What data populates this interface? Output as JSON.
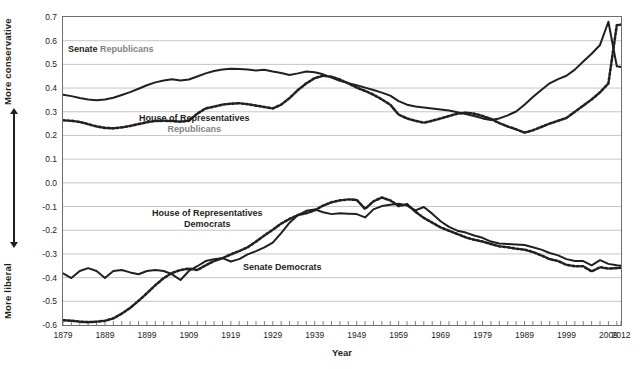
{
  "chart_data": {
    "type": "line",
    "title": "",
    "xlabel": "Year",
    "ylabel": "",
    "xlim": [
      1879,
      2012
    ],
    "ylim": [
      -0.6,
      0.7
    ],
    "grid": true,
    "legend_position": "inline-annotations",
    "y_ticks": [
      "0.7",
      "0.6",
      "0.5",
      "0.4",
      "0.3",
      "0.2",
      "0.1",
      "0.0",
      "-0.1",
      "-0.2",
      "-0.3",
      "-0.4",
      "-0.5",
      "-0.6"
    ],
    "y_tick_values": [
      0.7,
      0.6,
      0.5,
      0.4,
      0.3,
      0.2,
      0.1,
      0.0,
      -0.1,
      -0.2,
      -0.3,
      -0.4,
      -0.5,
      -0.6
    ],
    "x_ticks": [
      "1879",
      "1889",
      "1899",
      "1909",
      "1919",
      "1929",
      "1939",
      "1949",
      "1959",
      "1969",
      "1979",
      "1989",
      "1999",
      "2009",
      "2012"
    ],
    "x_tick_values": [
      1879,
      1889,
      1899,
      1909,
      1919,
      1929,
      1939,
      1949,
      1959,
      1969,
      1979,
      1989,
      1999,
      2009,
      2012
    ],
    "axis_direction_top": "More conservative",
    "axis_direction_bottom": "More liberal",
    "x": [
      1879,
      1881,
      1883,
      1885,
      1887,
      1889,
      1891,
      1893,
      1895,
      1897,
      1899,
      1901,
      1903,
      1905,
      1907,
      1909,
      1911,
      1913,
      1915,
      1917,
      1919,
      1921,
      1923,
      1925,
      1927,
      1929,
      1931,
      1933,
      1935,
      1937,
      1939,
      1941,
      1943,
      1945,
      1947,
      1949,
      1951,
      1953,
      1955,
      1957,
      1959,
      1961,
      1963,
      1965,
      1967,
      1969,
      1971,
      1973,
      1975,
      1977,
      1979,
      1981,
      1983,
      1985,
      1987,
      1989,
      1991,
      1993,
      1995,
      1997,
      1999,
      2001,
      2003,
      2005,
      2007,
      2009,
      2011,
      2012
    ],
    "series": [
      {
        "name": "Senate Republicans",
        "style": "solid",
        "color": "#231f20",
        "values": [
          0.372,
          0.366,
          0.358,
          0.352,
          0.349,
          0.352,
          0.359,
          0.371,
          0.383,
          0.397,
          0.412,
          0.424,
          0.432,
          0.437,
          0.432,
          0.436,
          0.449,
          0.462,
          0.472,
          0.478,
          0.482,
          0.481,
          0.478,
          0.474,
          0.477,
          0.47,
          0.464,
          0.455,
          0.462,
          0.47,
          0.467,
          0.458,
          0.444,
          0.431,
          0.421,
          0.412,
          0.402,
          0.392,
          0.381,
          0.368,
          0.345,
          0.33,
          0.322,
          0.318,
          0.314,
          0.31,
          0.305,
          0.298,
          0.29,
          0.282,
          0.272,
          0.265,
          0.272,
          0.285,
          0.301,
          0.33,
          0.362,
          0.392,
          0.42,
          0.438,
          0.452,
          0.478,
          0.512,
          0.545,
          0.582,
          0.68,
          0.492,
          0.489
        ]
      },
      {
        "name": "House of Representatives Republicans",
        "style": "dotted",
        "color": "#231f20",
        "values": [
          0.264,
          0.262,
          0.257,
          0.248,
          0.238,
          0.232,
          0.23,
          0.234,
          0.24,
          0.248,
          0.256,
          0.261,
          0.262,
          0.261,
          0.258,
          0.262,
          0.292,
          0.314,
          0.322,
          0.33,
          0.334,
          0.336,
          0.332,
          0.326,
          0.32,
          0.314,
          0.33,
          0.358,
          0.392,
          0.42,
          0.442,
          0.452,
          0.448,
          0.436,
          0.42,
          0.402,
          0.388,
          0.372,
          0.352,
          0.33,
          0.288,
          0.272,
          0.262,
          0.254,
          0.262,
          0.272,
          0.282,
          0.292,
          0.296,
          0.292,
          0.282,
          0.27,
          0.252,
          0.238,
          0.226,
          0.212,
          0.222,
          0.236,
          0.25,
          0.262,
          0.274,
          0.3,
          0.326,
          0.352,
          0.382,
          0.42,
          0.665,
          0.668
        ]
      },
      {
        "name": "Senate Democrats",
        "style": "solid",
        "color": "#231f20",
        "values": [
          -0.382,
          -0.402,
          -0.372,
          -0.36,
          -0.372,
          -0.402,
          -0.372,
          -0.368,
          -0.378,
          -0.386,
          -0.372,
          -0.368,
          -0.372,
          -0.386,
          -0.41,
          -0.372,
          -0.352,
          -0.33,
          -0.322,
          -0.318,
          -0.332,
          -0.322,
          -0.302,
          -0.288,
          -0.272,
          -0.252,
          -0.212,
          -0.168,
          -0.136,
          -0.118,
          -0.112,
          -0.124,
          -0.132,
          -0.128,
          -0.13,
          -0.132,
          -0.146,
          -0.112,
          -0.098,
          -0.092,
          -0.088,
          -0.096,
          -0.116,
          -0.102,
          -0.13,
          -0.162,
          -0.186,
          -0.202,
          -0.21,
          -0.222,
          -0.232,
          -0.248,
          -0.256,
          -0.258,
          -0.26,
          -0.262,
          -0.272,
          -0.282,
          -0.296,
          -0.306,
          -0.322,
          -0.33,
          -0.33,
          -0.348,
          -0.326,
          -0.342,
          -0.348,
          -0.35
        ]
      },
      {
        "name": "House of Representatives Democrats",
        "style": "dotted",
        "color": "#231f20",
        "values": [
          -0.58,
          -0.582,
          -0.586,
          -0.588,
          -0.586,
          -0.582,
          -0.572,
          -0.552,
          -0.528,
          -0.498,
          -0.466,
          -0.432,
          -0.402,
          -0.38,
          -0.368,
          -0.362,
          -0.368,
          -0.348,
          -0.33,
          -0.318,
          -0.302,
          -0.288,
          -0.272,
          -0.248,
          -0.222,
          -0.198,
          -0.172,
          -0.152,
          -0.136,
          -0.128,
          -0.116,
          -0.096,
          -0.082,
          -0.074,
          -0.07,
          -0.072,
          -0.11,
          -0.078,
          -0.062,
          -0.074,
          -0.098,
          -0.09,
          -0.122,
          -0.148,
          -0.168,
          -0.188,
          -0.202,
          -0.216,
          -0.23,
          -0.24,
          -0.248,
          -0.258,
          -0.268,
          -0.272,
          -0.278,
          -0.282,
          -0.292,
          -0.306,
          -0.322,
          -0.33,
          -0.346,
          -0.352,
          -0.352,
          -0.374,
          -0.356,
          -0.362,
          -0.36,
          -0.358
        ]
      }
    ],
    "annotations": [
      {
        "id": "senate-republicans",
        "line1_dark": "Senate",
        "line1_gray": "Republicans"
      },
      {
        "id": "house-republicans",
        "line1_dark": "House of Representatives",
        "line2_gray": "Republicans"
      },
      {
        "id": "house-democrats",
        "line1_dark": "House of Representatives",
        "line2_dark": "Democrats"
      },
      {
        "id": "senate-democrats",
        "line1_dark": "Senate Democrats"
      }
    ]
  },
  "annotations": {
    "senate_republicans_dark": "Senate",
    "senate_republicans_gray": "Republicans",
    "house_republicans_dark": "House of Representatives",
    "house_republicans_gray": "Republicans",
    "house_democrats_line1": "House of Representatives",
    "house_democrats_line2": "Democrats",
    "senate_democrats": "Senate Democrats"
  },
  "axis": {
    "x_title": "Year",
    "direction_top": "More conservative",
    "direction_bottom": "More liberal"
  },
  "colors": {
    "line": "#231f20",
    "gray_text": "#808285",
    "grid": "#b8b8b8",
    "frame": "#6e6e6e"
  }
}
